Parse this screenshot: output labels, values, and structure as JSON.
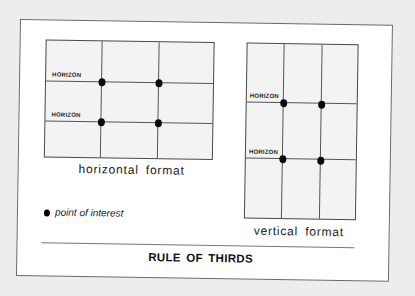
{
  "title": "RULE OF THIRDS",
  "horizontal_panel": {
    "caption": "horizontal format",
    "horizon_labels": [
      "HORIZON",
      "HORIZON"
    ],
    "points_of_interest": 4
  },
  "vertical_panel": {
    "caption": "vertical format",
    "horizon_labels": [
      "HORIZON",
      "HORIZON"
    ],
    "points_of_interest": 4
  },
  "legend": {
    "symbol": "filled-dot",
    "label": "point of interest"
  },
  "colors": {
    "background": "#ededed",
    "card": "#ffffff",
    "grid_fill": "#f3f3f3",
    "lines": "#555555",
    "dots": "#0a0a0a"
  }
}
